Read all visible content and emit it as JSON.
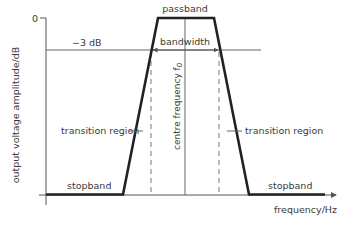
{
  "diagram": {
    "type": "band-pass filter frequency response",
    "y_axis": {
      "label": "output voltage amplitude/dB",
      "tick_label_top": "0"
    },
    "x_axis": {
      "label": "frequency/Hz"
    },
    "labels": {
      "minus_3db": "−3 dB",
      "passband": "passband",
      "bandwidth": "bandwidth",
      "centre_frequency": "centre frequency f",
      "centre_frequency_sub": "0",
      "transition_left": "transition region",
      "transition_right": "transition region",
      "stopband_left": "stopband",
      "stopband_right": "stopband"
    },
    "colors": {
      "response_curve": "#222222",
      "axis": "#555555",
      "guide_lines": "#666666",
      "text": "#3a3a3a"
    }
  }
}
